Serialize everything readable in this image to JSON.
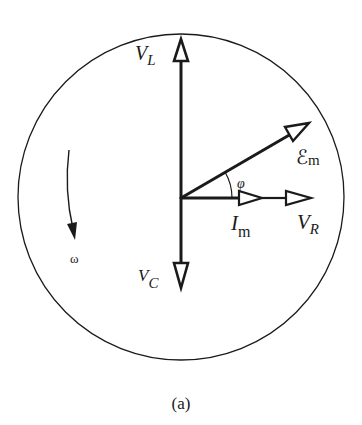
{
  "diagram": {
    "type": "phasor-diagram",
    "caption": "(a)",
    "rotation": {
      "symbol": "ω",
      "direction": "counterclockwise-indicator (arrow pointing down on left side)"
    },
    "phasors": [
      {
        "id": "VL",
        "label_main": "V",
        "label_sub": "L",
        "direction": "up"
      },
      {
        "id": "VC",
        "label_main": "V",
        "label_sub": "C",
        "direction": "down"
      },
      {
        "id": "Em",
        "label_main": "ℰ",
        "label_sub": "m",
        "direction": "up-right (angle φ above horizontal)"
      },
      {
        "id": "Im",
        "label_main": "I",
        "label_sub": "m",
        "direction": "right"
      },
      {
        "id": "VR",
        "label_main": "V",
        "label_sub": "R",
        "direction": "right"
      }
    ],
    "angle": {
      "symbol": "φ",
      "between": [
        "Im",
        "Em"
      ]
    }
  }
}
